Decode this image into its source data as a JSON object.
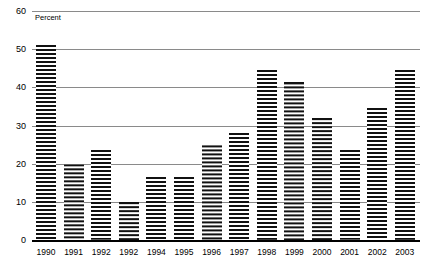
{
  "chart_data": {
    "type": "bar",
    "title": "",
    "subtitle": "",
    "axis_note": "Percent",
    "xlabel": "",
    "ylabel": "",
    "ylim": [
      0,
      60
    ],
    "yticks": [
      0,
      10,
      20,
      30,
      40,
      50,
      60
    ],
    "grid": true,
    "legend": "none",
    "categories": [
      "1990",
      "1991",
      "1992",
      "1992",
      "1994",
      "1995",
      "1996",
      "1997",
      "1998",
      "1999",
      "2000",
      "2001",
      "2002",
      "2003"
    ],
    "values": [
      51,
      20,
      23.5,
      10,
      16.5,
      16.5,
      25,
      28,
      44.5,
      41.5,
      32,
      23.5,
      34.5,
      44.5
    ],
    "bar_color": "#111111",
    "bar_pattern": "horizontal-stripes",
    "gridline_color": "#8a8a8a",
    "axis_color": "#000000"
  }
}
